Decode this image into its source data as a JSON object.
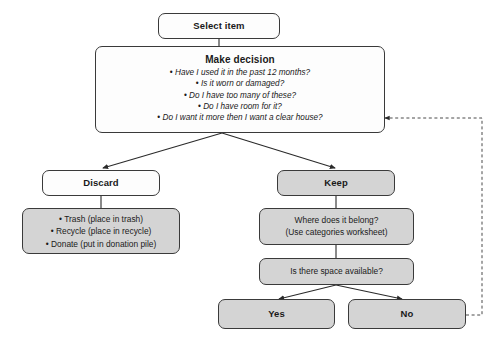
{
  "diagram": {
    "colors": {
      "stroke": "#3a3a3a",
      "node_white": "#fdfdfd",
      "node_gray": "#d4d4d4",
      "background": "#ffffff",
      "text": "#1a1a1a"
    }
  },
  "nodes": {
    "select_item": {
      "label": "Select item"
    },
    "make_decision": {
      "title": "Make decision",
      "bullets": [
        "Have I used it in the past 12 months?",
        "Is it worn or damaged?",
        "Do I have too many of these?",
        "Do I have room for it?",
        "Do I want it more then I want a clear house?"
      ]
    },
    "discard": {
      "label": "Discard"
    },
    "discard_actions": {
      "bullets": [
        "Trash (place in trash)",
        "Recycle (place in recycle)",
        "Donate (put in donation pile)"
      ]
    },
    "keep": {
      "label": "Keep"
    },
    "where_belong": {
      "line1": "Where does it belong?",
      "line2": "(Use categories worksheet)"
    },
    "space_available": {
      "label": "Is there space available?"
    },
    "yes": {
      "label": "Yes"
    },
    "no": {
      "label": "No"
    }
  },
  "edges": [
    {
      "name": "select-to-decision",
      "style": "solid",
      "arrow": false
    },
    {
      "name": "decision-to-discard",
      "style": "solid",
      "arrow": true
    },
    {
      "name": "decision-to-keep",
      "style": "solid",
      "arrow": true
    },
    {
      "name": "discard-to-actions",
      "style": "solid",
      "arrow": false
    },
    {
      "name": "keep-to-where-belong",
      "style": "solid",
      "arrow": false
    },
    {
      "name": "where-belong-to-space",
      "style": "solid",
      "arrow": false
    },
    {
      "name": "space-to-yes",
      "style": "solid",
      "arrow": true
    },
    {
      "name": "space-to-no",
      "style": "solid",
      "arrow": true
    },
    {
      "name": "no-back-to-decision",
      "style": "dashed",
      "arrow": true
    }
  ]
}
